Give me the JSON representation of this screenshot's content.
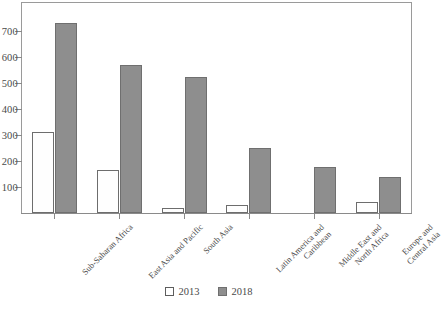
{
  "chart_data": {
    "type": "bar",
    "title": "",
    "xlabel": "",
    "ylabel": "",
    "ylim": [
      0,
      760
    ],
    "yticks": [
      100,
      200,
      300,
      400,
      500,
      600,
      700
    ],
    "ytick_labels": [
      "100",
      "200",
      "300",
      "400",
      "500",
      "600",
      "700"
    ],
    "grid": false,
    "legend_position": "bottom",
    "categories": [
      "Sub-Saharan Africa",
      "East Asia and Pacific",
      "South Asia",
      "Latin America and Caribbean",
      "Middle East and North Africa",
      "Europe and Central Asia"
    ],
    "category_lines": [
      [
        "Sub-Saharan Africa"
      ],
      [
        "East Asia and Pacific"
      ],
      [
        "South Asia"
      ],
      [
        "Latin America and",
        "Caribbean"
      ],
      [
        "Middle East and",
        "North Africa"
      ],
      [
        "Europe and",
        "Central Asia"
      ]
    ],
    "series": [
      {
        "name": "2013",
        "color": "#ffffff",
        "values": [
          311,
          167,
          21,
          29,
          0,
          42
        ]
      },
      {
        "name": "2018",
        "color": "#8e8e8e",
        "values": [
          730,
          568,
          523,
          249,
          177,
          139
        ]
      }
    ]
  },
  "legend": {
    "items": [
      {
        "label": "2013",
        "swatch": "open-square-swatch"
      },
      {
        "label": "2018",
        "swatch": "filled-square-swatch"
      }
    ]
  },
  "axis": {
    "y_tick_labels": [
      "700",
      "600",
      "500",
      "400",
      "300",
      "200",
      "100"
    ]
  },
  "colors": {
    "bar_2013_fill": "#ffffff",
    "bar_2018_fill": "#8e8e8e",
    "bar_stroke": "#6f6f6f",
    "frame": "#9a9a9a",
    "text": "#4a4a4a"
  }
}
